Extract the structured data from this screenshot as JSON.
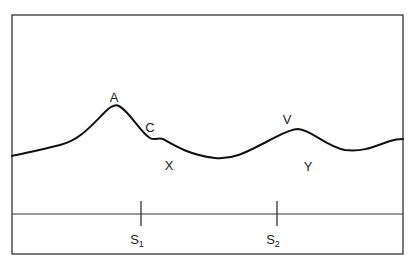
{
  "diagram": {
    "type": "profile",
    "frame": {
      "x": 12,
      "y": 15,
      "width": 391,
      "height": 239,
      "stroke": "#333333"
    },
    "curve": {
      "stroke": "#111111",
      "path": "M12,156 C30,152 45,149 60,145 C80,140 92,125 105,112 C110,107 115,104 119,106 C130,112 140,132 150,138 C155,141 158,137 163,139 C175,146 190,155 215,158 C235,160 250,150 270,140 C280,135 290,129 298,129 C312,130 325,146 345,150 C365,152 375,146 390,141 C396,139 400,139 403,139"
    },
    "labels": [
      {
        "id": "A",
        "text": "A",
        "x": 114,
        "y": 102
      },
      {
        "id": "C",
        "text": "C",
        "x": 150,
        "y": 132
      },
      {
        "id": "X",
        "text": "X",
        "x": 169,
        "y": 170
      },
      {
        "id": "V",
        "text": "V",
        "x": 287,
        "y": 124
      },
      {
        "id": "Y",
        "text": "Y",
        "x": 308,
        "y": 171
      }
    ],
    "baseline": {
      "y": 214,
      "x1": 12,
      "x2": 403
    },
    "stations": [
      {
        "id": "S1",
        "letter": "S",
        "subscript": "1",
        "x": 141,
        "tick_top": 201,
        "tick_bottom": 226,
        "label_y": 244
      },
      {
        "id": "S2",
        "letter": "S",
        "subscript": "2",
        "x": 277,
        "tick_top": 201,
        "tick_bottom": 226,
        "label_y": 244
      }
    ]
  }
}
